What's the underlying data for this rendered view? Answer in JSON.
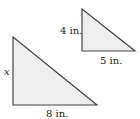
{
  "figure": {
    "fill_color": "#eeeeee",
    "stroke_color": "#444444",
    "large_triangle": {
      "vertical_leg_label": "x",
      "horizontal_leg_label": "8 in.",
      "points": {
        "top": [
          13,
          37
        ],
        "right_angle": [
          13,
          105
        ],
        "right": [
          97,
          105
        ]
      }
    },
    "small_triangle": {
      "vertical_leg_label": "4 in.",
      "horizontal_leg_label": "5 in.",
      "points": {
        "top": [
          82,
          9
        ],
        "right_angle": [
          82,
          51
        ],
        "right": [
          135,
          51
        ]
      }
    }
  }
}
